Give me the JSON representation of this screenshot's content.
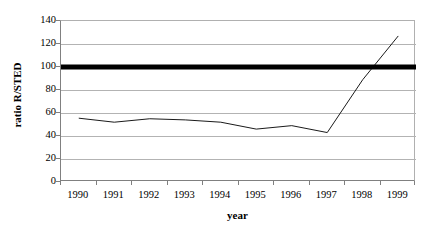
{
  "chart_data": {
    "type": "line",
    "title": "",
    "xlabel": "year",
    "ylabel": "ratio R/STED",
    "x": [
      "1990",
      "1991",
      "1992",
      "1993",
      "1994",
      "1995",
      "1996",
      "1997",
      "1998",
      "1999"
    ],
    "categories": [
      "1990",
      "1991",
      "1992",
      "1993",
      "1994",
      "1995",
      "1996",
      "1997",
      "1998",
      "1999"
    ],
    "xlim": [
      1989.5,
      1999.5
    ],
    "ylim": [
      0,
      140
    ],
    "ytick_labels": [
      "0",
      "20",
      "40",
      "60",
      "80",
      "100",
      "120",
      "140"
    ],
    "ytick_values": [
      0,
      20,
      40,
      60,
      80,
      100,
      120,
      140
    ],
    "grid": "horizontal",
    "legend": "none",
    "series": [
      {
        "name": "ratio R/STED",
        "color": "#1a1a1a",
        "line_width": 1,
        "values": [
          55.5,
          52,
          55,
          54,
          52,
          46,
          49,
          43,
          89,
          127
        ]
      },
      {
        "name": "reference level 100",
        "color": "#000000",
        "line_width": 5,
        "constant": 100,
        "values": [
          100,
          100,
          100,
          100,
          100,
          100,
          100,
          100,
          100,
          100
        ]
      }
    ],
    "annotations": []
  },
  "axes": {
    "y_title": "ratio R/STED",
    "x_title": "year"
  },
  "colors": {
    "background": "#ffffff",
    "grid": "#b3b3b3",
    "axis": "#808080",
    "data_line": "#1a1a1a",
    "reference_line": "#000000",
    "text": "#000000"
  }
}
